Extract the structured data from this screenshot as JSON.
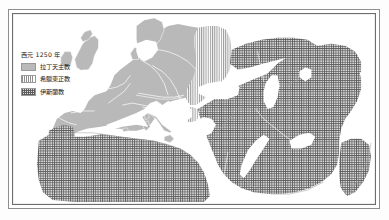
{
  "figure": {
    "name": "religions-map-1250",
    "frame_color": "#6d6d6d",
    "background_color": "#ffffff"
  },
  "legend": {
    "title": "西元 1250 年",
    "entries": [
      {
        "label": "拉丁天主教",
        "pattern": "solid",
        "color": "#b9b9b9"
      },
      {
        "label": "希臘東正教",
        "pattern": "vertical-stripes",
        "color": "#8f8f8f"
      },
      {
        "label": "伊斯蘭教",
        "pattern": "cross-hatch",
        "color": "#5c5c5c"
      }
    ]
  },
  "map": {
    "projection_note": "Europe, North Africa, Near East and Central Asia",
    "sea_color": "#ffffff",
    "land_catholic_color": "#b9b9b9",
    "border_line_color": "#ffffff",
    "coastline_color": "#9e9e9e",
    "regions": [
      {
        "name": "latin-catholic-europe",
        "religion": "拉丁天主教",
        "pattern": "solid"
      },
      {
        "name": "greek-orthodox-balkans-rus",
        "religion": "希臘東正教",
        "pattern": "vertical-stripes"
      },
      {
        "name": "islamic-world",
        "religion": "伊斯蘭教",
        "pattern": "cross-hatch"
      }
    ]
  }
}
